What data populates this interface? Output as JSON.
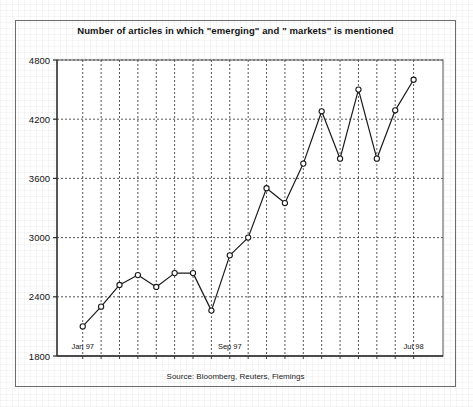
{
  "figure": {
    "title": "Number of articles in which \"emerging\" and \" markets\" is mentioned",
    "source": "Source: Bloomberg, Reuters, Flemings",
    "frame_color": "#6b6b6b",
    "background": "#ffffff"
  },
  "chart_data": {
    "type": "line",
    "title": "Number of articles in which \"emerging\" and \" markets\" is mentioned",
    "subtitle": "",
    "xlabel": "",
    "ylabel": "",
    "ylim": [
      1800,
      4800
    ],
    "yticks": [
      1800,
      2400,
      3000,
      3600,
      4200,
      4800
    ],
    "ytick_labels": [
      "1800",
      "2400",
      "3000",
      "3600",
      "4200",
      "4800"
    ],
    "grid": true,
    "grid_style": "dotted",
    "legend": "none",
    "marker": "open-circle",
    "line_color": "#1a1a1a",
    "x": [
      "Jan 97",
      "Feb 97",
      "Mar 97",
      "Apr 97",
      "May 97",
      "Jun 97",
      "Jul 97",
      "Aug 97",
      "Sep 97",
      "Oct 97",
      "Nov 97",
      "Dec 97",
      "Jan 98",
      "Feb 98",
      "Mar 98",
      "Apr 98",
      "May 98",
      "Jun 98",
      "Jul 98"
    ],
    "xtick_labels_shown": [
      "Jan 97",
      "Sep 97",
      "Jul 98"
    ],
    "xtick_label_positions": [
      0,
      8,
      18
    ],
    "series": [
      {
        "name": "Articles mentioning \"emerging markets\"",
        "values": [
          2100,
          2300,
          2520,
          2620,
          2500,
          2640,
          2640,
          2260,
          2820,
          3000,
          3500,
          3350,
          3750,
          4280,
          3800,
          4500,
          3800,
          4290,
          4600
        ]
      }
    ]
  },
  "axis": {
    "y_label_texts": [
      "4800",
      "4200",
      "3600",
      "3000",
      "2400",
      "1800"
    ],
    "x_label_texts": [
      "Jan 97",
      "Sep 97",
      "Jul 98"
    ]
  }
}
